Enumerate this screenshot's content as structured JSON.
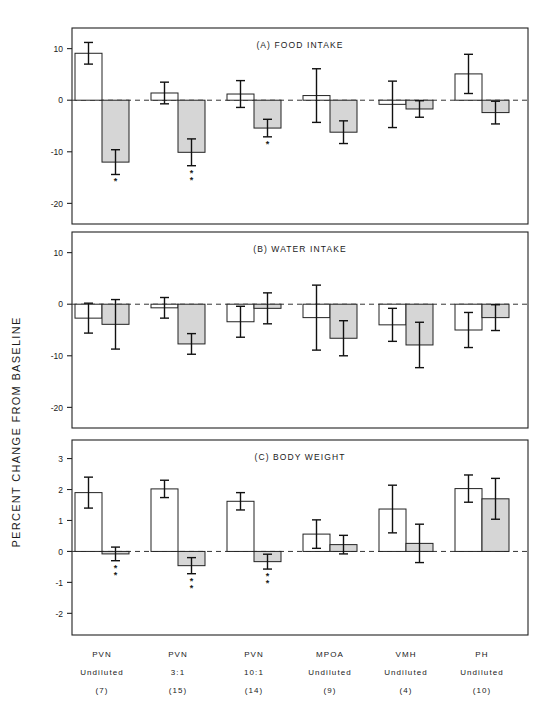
{
  "figure": {
    "axis_title": "PERCENT CHANGE FROM BASELINE",
    "groups": [
      {
        "site": "PVN",
        "dilution": "Undiluted",
        "n": "(7)"
      },
      {
        "site": "PVN",
        "dilution": "3:1",
        "n": "(15)"
      },
      {
        "site": "PVN",
        "dilution": "10:1",
        "n": "(14)"
      },
      {
        "site": "MPOA",
        "dilution": "Undiluted",
        "n": "(9)"
      },
      {
        "site": "VMH",
        "dilution": "Undiluted",
        "n": "(4)"
      },
      {
        "site": "PH",
        "dilution": "Undiluted",
        "n": "(10)"
      }
    ],
    "colors": {
      "open_bar": "#ffffff",
      "shaded_bar": "#d6d6d6",
      "outline": "#222222",
      "text": "#1a1a1a"
    }
  },
  "chart_data": [
    {
      "type": "bar",
      "panel": "A",
      "title": "(A) FOOD INTAKE",
      "xlabel": "",
      "ylabel": "PERCENT CHANGE FROM BASELINE",
      "ylim": [
        -24,
        14
      ],
      "yticks": [
        10,
        0,
        -10,
        -20
      ],
      "ytick_labels": [
        "10",
        "0",
        "-10",
        "-20"
      ],
      "grid": false,
      "categories": [
        "PVN Undiluted",
        "PVN 3:1",
        "PVN 10:1",
        "MPOA Undiluted",
        "VMH Undiluted",
        "PH Undiluted"
      ],
      "series": [
        {
          "name": "Open (control)",
          "style": "open",
          "values": [
            9.1,
            1.4,
            1.2,
            0.9,
            -0.8,
            5.1
          ],
          "errors": [
            2.1,
            2.1,
            2.6,
            5.2,
            4.5,
            3.8
          ],
          "significance": [
            "",
            "",
            "",
            "",
            "",
            ""
          ]
        },
        {
          "name": "Shaded (treatment)",
          "style": "shaded",
          "values": [
            -12.0,
            -10.1,
            -5.4,
            -6.2,
            -1.7,
            -2.4
          ],
          "errors": [
            2.4,
            2.6,
            1.7,
            2.2,
            1.6,
            2.2
          ],
          "significance": [
            "*",
            "**",
            "*",
            "",
            "",
            ""
          ]
        }
      ]
    },
    {
      "type": "bar",
      "panel": "B",
      "title": "(B) WATER INTAKE",
      "xlabel": "",
      "ylabel": "PERCENT CHANGE FROM BASELINE",
      "ylim": [
        -24,
        14
      ],
      "yticks": [
        10,
        0,
        -10,
        -20
      ],
      "ytick_labels": [
        "10",
        "0",
        "-10",
        "-20"
      ],
      "grid": false,
      "categories": [
        "PVN Undiluted",
        "PVN 3:1",
        "PVN 10:1",
        "MPOA Undiluted",
        "VMH Undiluted",
        "PH Undiluted"
      ],
      "series": [
        {
          "name": "Open (control)",
          "style": "open",
          "values": [
            -2.7,
            -0.7,
            -3.4,
            -2.6,
            -4.0,
            -5.0
          ],
          "errors": [
            2.9,
            2.0,
            3.0,
            6.3,
            3.2,
            3.4
          ],
          "significance": [
            "",
            "",
            "",
            "",
            "",
            ""
          ]
        },
        {
          "name": "Shaded (treatment)",
          "style": "shaded",
          "values": [
            -3.9,
            -7.7,
            -0.8,
            -6.6,
            -7.9,
            -2.6
          ],
          "errors": [
            4.8,
            2.0,
            3.0,
            3.4,
            4.4,
            2.5
          ],
          "significance": [
            "",
            "",
            "",
            "",
            "",
            ""
          ]
        }
      ]
    },
    {
      "type": "bar",
      "panel": "C",
      "title": "(C) BODY WEIGHT",
      "xlabel": "",
      "ylabel": "PERCENT CHANGE FROM BASELINE",
      "ylim": [
        -2.7,
        3.6
      ],
      "yticks": [
        3,
        2,
        1,
        0,
        -1,
        -2
      ],
      "ytick_labels": [
        "3",
        "2",
        "1",
        "0",
        "-1",
        "-2"
      ],
      "grid": false,
      "categories": [
        "PVN Undiluted",
        "PVN 3:1",
        "PVN 10:1",
        "MPOA Undiluted",
        "VMH Undiluted",
        "PH Undiluted"
      ],
      "series": [
        {
          "name": "Open (control)",
          "style": "open",
          "values": [
            1.9,
            2.02,
            1.62,
            0.56,
            1.37,
            2.03
          ],
          "errors": [
            0.5,
            0.28,
            0.28,
            0.46,
            0.77,
            0.44
          ],
          "significance": [
            "",
            "",
            "",
            "",
            "",
            ""
          ]
        },
        {
          "name": "Shaded (treatment)",
          "style": "shaded",
          "values": [
            -0.08,
            -0.46,
            -0.33,
            0.22,
            0.26,
            1.7
          ],
          "errors": [
            0.22,
            0.26,
            0.24,
            0.3,
            0.62,
            0.66
          ],
          "significance": [
            "**",
            "**",
            "**",
            "",
            "",
            ""
          ]
        }
      ]
    }
  ]
}
